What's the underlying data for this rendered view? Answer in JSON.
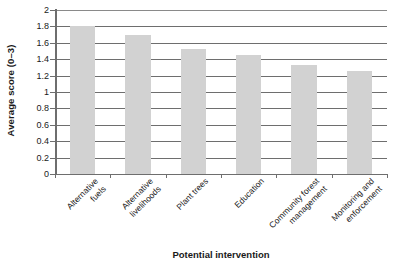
{
  "chart_data": {
    "type": "bar",
    "title": "",
    "subtitle": "",
    "xlabel": "Potential intervention",
    "ylabel": "Average score (0–3)",
    "categories": [
      "Alternative fuels",
      "Alternative livelihoods",
      "Plant trees",
      "Education",
      "Community forest management",
      "Monitoring and enforcement"
    ],
    "category_lines": [
      [
        "Alternative",
        "fuels"
      ],
      [
        "Alternative",
        "livelihoods"
      ],
      [
        "Plant trees"
      ],
      [
        "Education"
      ],
      [
        "Community forest",
        "management"
      ],
      [
        "Monitoring and",
        "enforcement"
      ]
    ],
    "values": [
      1.8,
      1.7,
      1.52,
      1.45,
      1.33,
      1.26
    ],
    "ylim": [
      0,
      2
    ],
    "ytick_values": [
      0,
      0.2,
      0.4,
      0.6,
      0.8,
      1,
      1.2,
      1.4,
      1.6,
      1.8,
      2
    ],
    "ytick_labels": [
      "0",
      "0.2",
      "0.4",
      "0.6",
      "0.8",
      "1",
      "1.2",
      "1.4",
      "1.6",
      "1.8",
      "2"
    ],
    "grid": true,
    "grid_axis": "y",
    "legend": false,
    "legend_position": "none",
    "bar_color": "#d2d2d2",
    "axis_color": "#6e6e6e",
    "text_color": "#1a1a1a",
    "background_color": "#ffffff"
  }
}
